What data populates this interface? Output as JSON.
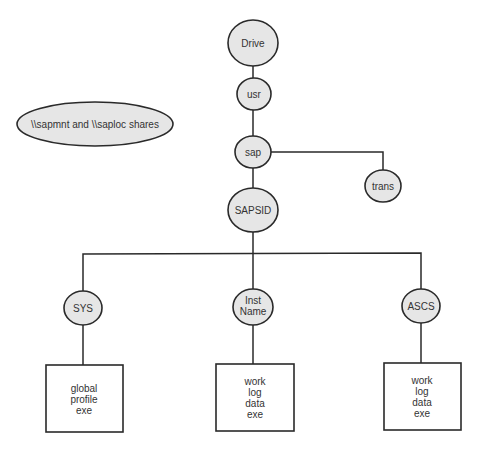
{
  "diagram": {
    "legend_label": "\\\\sapmnt and \\\\saploc shares",
    "nodes": {
      "drive": "Drive",
      "usr": "usr",
      "sap": "sap",
      "trans": "trans",
      "sapsid": "SAPSID",
      "sys": "SYS",
      "inst_name_1": "Inst",
      "inst_name_2": "Name",
      "ascs": "ASCS"
    },
    "boxes": {
      "sys": [
        "global",
        "profile",
        "exe"
      ],
      "inst": [
        "work",
        "log",
        "data",
        "exe"
      ],
      "ascs": [
        "work",
        "log",
        "data",
        "exe"
      ]
    }
  }
}
